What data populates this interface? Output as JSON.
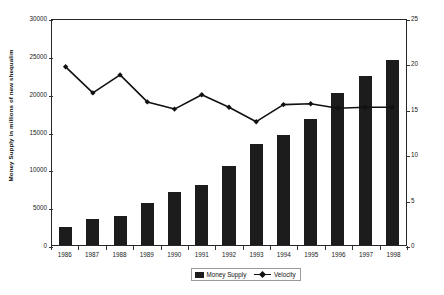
{
  "chart_data": {
    "type": "bar",
    "title": "",
    "xlabel": "",
    "ylabel": "Money Supply in millions of new shequalim",
    "y2label": "Velocity",
    "categories": [
      "1986",
      "1987",
      "1988",
      "1989",
      "1990",
      "1991",
      "1992",
      "1993",
      "1994",
      "1995",
      "1996",
      "1997",
      "1998"
    ],
    "ylim": [
      0,
      30000
    ],
    "y2lim": [
      0,
      25
    ],
    "yticks": [
      0,
      5000,
      10000,
      15000,
      20000,
      25000,
      30000
    ],
    "yticklabels": [
      "0",
      "5000",
      "10000",
      "15000",
      "20000",
      "25000",
      "30000"
    ],
    "y2ticks": [
      0,
      5,
      10,
      15,
      20,
      25
    ],
    "y2ticklabels": [
      "0",
      "5",
      "10",
      "15",
      "20",
      "25"
    ],
    "grid": false,
    "legend_position": "bottom",
    "series": [
      {
        "name": "Money Supply",
        "kind": "bar",
        "axis": "left",
        "color": "#1c1c1c",
        "values": [
          2400,
          3500,
          3900,
          5500,
          7000,
          7900,
          10500,
          13300,
          14500,
          16600,
          20100,
          22300,
          24500
        ]
      },
      {
        "name": "Velocity",
        "kind": "line",
        "axis": "right",
        "color": "#111111",
        "marker": "diamond",
        "values": [
          19.8,
          16.9,
          18.9,
          15.9,
          15.1,
          16.7,
          15.3,
          13.7,
          15.6,
          15.7,
          15.2,
          15.3,
          15.3
        ]
      }
    ]
  },
  "legend": {
    "entries": [
      {
        "label": "Money Supply",
        "swatch": "bar-swatch-icon"
      },
      {
        "label": "Velocity",
        "swatch": "line-marker-icon"
      }
    ]
  },
  "caption": ""
}
